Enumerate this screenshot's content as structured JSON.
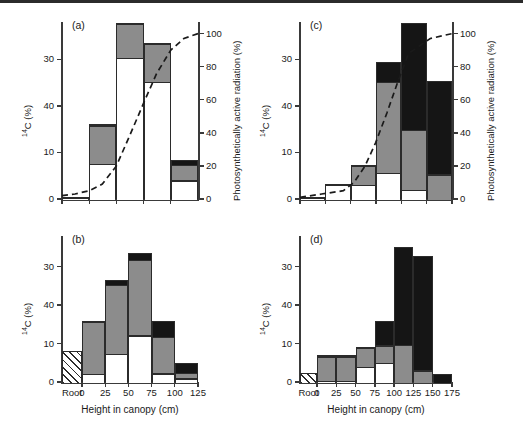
{
  "figure": {
    "x_axis_title": "Height in canopy (cm)",
    "y_axis_title": "14C (%)",
    "y_axis_title_sup": "14",
    "y_axis_title_rest": "C (%)",
    "y2_axis_title": "Photosynthetically active radiation (%)"
  },
  "chart_data": [
    {
      "type": "bar",
      "panel": "(a)",
      "title": "",
      "xlabel": "",
      "ylabel": "14C (%)",
      "y2label": "Photosynthetically active radiation (%)",
      "stacked": true,
      "categories": [
        "Root",
        "0",
        "25",
        "50",
        "75",
        "100",
        "125"
      ],
      "bin_labels": [
        "0",
        "25",
        "50",
        "75",
        "100"
      ],
      "tick_labels": [
        "0",
        "10",
        "40",
        "30"
      ],
      "tick_values": [
        0,
        10,
        20,
        30
      ],
      "ylim": [
        0,
        38
      ],
      "y2_tick_labels": [
        "0",
        "20",
        "40",
        "60",
        "80",
        "100"
      ],
      "y2_tick_values": [
        0,
        20,
        40,
        60,
        80,
        100
      ],
      "y2lim": [
        0,
        107
      ],
      "has_root_bar": false,
      "has_par_axis": true,
      "grid": false,
      "series": [
        {
          "name": "white",
          "values": [
            0.5,
            7.8,
            30.5,
            25.3,
            4.2
          ]
        },
        {
          "name": "gray",
          "values": [
            0.0,
            8.2,
            7.3,
            8.2,
            3.4
          ]
        },
        {
          "name": "black",
          "values": [
            0.0,
            0.0,
            0.0,
            0.0,
            0.7
          ]
        }
      ],
      "totals": [
        0.5,
        16.0,
        37.8,
        33.5,
        8.3
      ],
      "par_curve": {
        "name": "Photosynthetically active radiation",
        "style": "dashed",
        "x": [
          0,
          12,
          25,
          37,
          50,
          62,
          75,
          87,
          100,
          112,
          125
        ],
        "y": [
          2,
          3,
          5,
          9,
          20,
          38,
          58,
          76,
          90,
          97,
          100
        ]
      }
    },
    {
      "type": "bar",
      "panel": "(b)",
      "title": "",
      "xlabel": "Height in canopy (cm)",
      "ylabel": "14C (%)",
      "stacked": true,
      "categories": [
        "Root",
        "0",
        "25",
        "50",
        "75",
        "100",
        "125"
      ],
      "bin_labels": [
        "Root",
        "0",
        "25",
        "50",
        "75",
        "100",
        "125"
      ],
      "tick_labels": [
        "0",
        "10",
        "40",
        "30"
      ],
      "tick_values": [
        0,
        10,
        20,
        30
      ],
      "ylim": [
        0,
        38
      ],
      "has_root_bar": true,
      "has_par_axis": false,
      "grid": false,
      "root_value": 8.0,
      "series": [
        {
          "name": "white",
          "values": [
            2.4,
            7.6,
            12.4,
            2.5,
            1.2
          ]
        },
        {
          "name": "gray",
          "values": [
            13.6,
            17.9,
            19.6,
            9.5,
            1.5
          ]
        },
        {
          "name": "black",
          "values": [
            0.0,
            1.0,
            1.5,
            4.0,
            2.3
          ]
        }
      ],
      "totals": [
        16.0,
        26.5,
        33.5,
        16.0,
        5.0
      ],
      "par_curve": null
    },
    {
      "type": "bar",
      "panel": "(c)",
      "title": "",
      "xlabel": "",
      "ylabel": "14C (%)",
      "y2label": "Photosynthetically active radiation (%)",
      "stacked": true,
      "categories": [
        "Root",
        "0",
        "25",
        "50",
        "75",
        "100",
        "125",
        "150",
        "175"
      ],
      "bin_labels": [
        "0",
        "25",
        "50",
        "75",
        "100",
        "125",
        "150"
      ],
      "tick_labels": [
        "0",
        "10",
        "40",
        "30"
      ],
      "tick_values": [
        0,
        10,
        20,
        30
      ],
      "ylim": [
        0,
        38
      ],
      "y2_tick_labels": [
        "0",
        "20",
        "40",
        "60",
        "80",
        "100"
      ],
      "y2_tick_values": [
        0,
        20,
        40,
        60,
        80,
        100
      ],
      "y2lim": [
        0,
        107
      ],
      "has_root_bar": false,
      "has_par_axis": true,
      "grid": false,
      "series": [
        {
          "name": "white",
          "values": [
            0.4,
            3.2,
            3.2,
            5.9,
            2.2,
            0.0
          ]
        },
        {
          "name": "gray",
          "values": [
            0.0,
            0.0,
            4.1,
            19.5,
            12.8,
            5.5
          ]
        },
        {
          "name": "black",
          "values": [
            0.0,
            0.0,
            0.0,
            4.1,
            22.8,
            19.8
          ]
        }
      ],
      "totals": [
        0.4,
        3.2,
        7.3,
        29.5,
        37.8,
        25.3
      ],
      "par_curve": {
        "name": "Photosynthetically active radiation",
        "style": "dashed",
        "x": [
          0,
          25,
          50,
          62,
          75,
          87,
          100,
          112,
          125,
          150,
          175
        ],
        "y": [
          1,
          3,
          5,
          10,
          20,
          34,
          52,
          70,
          88,
          97,
          100
        ]
      }
    },
    {
      "type": "bar",
      "panel": "(d)",
      "title": "",
      "xlabel": "Height in canopy (cm)",
      "ylabel": "14C (%)",
      "stacked": true,
      "categories": [
        "Root",
        "0",
        "25",
        "50",
        "75",
        "100",
        "125",
        "150",
        "175"
      ],
      "bin_labels": [
        "Root",
        "0",
        "25",
        "50",
        "75",
        "100",
        "125",
        "150",
        "175"
      ],
      "tick_labels": [
        "0",
        "10",
        "40",
        "30"
      ],
      "tick_values": [
        0,
        10,
        20,
        30
      ],
      "ylim": [
        0,
        38
      ],
      "has_root_bar": true,
      "has_par_axis": false,
      "grid": false,
      "root_value": 2.3,
      "series": [
        {
          "name": "white",
          "values": [
            0.6,
            0.6,
            4.2,
            5.2,
            0.0,
            0.0,
            0.0
          ]
        },
        {
          "name": "gray",
          "values": [
            6.3,
            6.3,
            5.0,
            4.6,
            10.0,
            3.3,
            0.0
          ]
        },
        {
          "name": "black",
          "values": [
            0.0,
            0.0,
            0.0,
            6.2,
            25.2,
            29.4,
            2.2
          ]
        }
      ],
      "totals": [
        6.9,
        6.9,
        9.2,
        16.0,
        35.2,
        32.7,
        2.2
      ],
      "par_curve": null
    }
  ]
}
